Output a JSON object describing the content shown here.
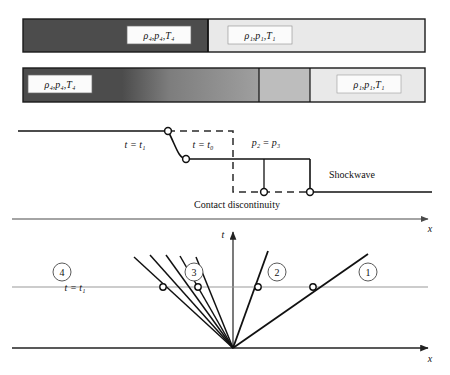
{
  "figure": {
    "colors": {
      "gas4_dark": "#4c4c4c",
      "gas3_mid": "#8f8f8f",
      "gas2_light": "#bdbdbd",
      "gas1_lightest": "#e9e9e9",
      "tube_outline": "#1a1a1a",
      "line": "#111111",
      "gridline": "#9a9a9a",
      "label_box_fill": "#fbfbfb"
    }
  },
  "tube_initial": {
    "name": "initial-state-tube",
    "driver_label": "ρ₄,p₄,T₄",
    "driven_label": "ρ₁,p₁,T₁",
    "diaphragm_x": 208
  },
  "tube_after": {
    "name": "after-rupture-tube",
    "driver_label": "ρ₄,p₄,T₄",
    "driven_label": "ρ₁,p₁,T₁",
    "contact_x": 259,
    "shock_x": 310
  },
  "pressure_plot": {
    "name": "pressure-profile",
    "labels": {
      "t1": "t = t₁",
      "t0": "t = t₀",
      "p2p3": "p₂ = p₃",
      "shockwave": "Shockwave",
      "contact": "Contact discontinuity"
    },
    "levels": {
      "p4": 131,
      "p2p3": 159,
      "p1": 192
    },
    "markers": [
      {
        "x": 168,
        "y": 131
      },
      {
        "x": 186,
        "y": 159
      },
      {
        "x": 264,
        "y": 192
      },
      {
        "x": 310,
        "y": 192
      }
    ]
  },
  "xt_diagram": {
    "name": "x-t-diagram",
    "axis_x_top_label": "x",
    "axis_x_bottom_label": "x",
    "axis_t_label": "t",
    "t1_label": "t = t₁",
    "regions": [
      {
        "id": "4",
        "cx": 62,
        "cy": 272
      },
      {
        "id": "3",
        "cx": 194,
        "cy": 272
      },
      {
        "id": "2",
        "cx": 277,
        "cy": 272
      },
      {
        "id": "1",
        "cx": 368,
        "cy": 272
      }
    ],
    "markers_on_t1": [
      {
        "x": 163,
        "y": 287
      },
      {
        "x": 198,
        "y": 287
      },
      {
        "x": 258,
        "y": 287
      },
      {
        "x": 313,
        "y": 287
      }
    ],
    "origin": {
      "x": 233,
      "y": 348
    },
    "expansion_fan_tips": [
      {
        "x": 134,
        "y": 257
      },
      {
        "x": 150,
        "y": 255
      },
      {
        "x": 166,
        "y": 255
      },
      {
        "x": 180,
        "y": 256
      },
      {
        "x": 196,
        "y": 257
      }
    ],
    "contact_line_tip": {
      "x": 268,
      "y": 251
    },
    "shock_line_tip": {
      "x": 368,
      "y": 254
    }
  }
}
